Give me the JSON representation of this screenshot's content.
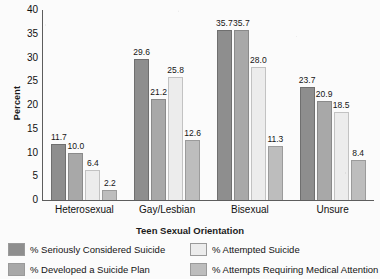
{
  "chart_data": {
    "type": "bar",
    "title": "",
    "xlabel": "Teen Sexual Orientation",
    "ylabel": "Percent",
    "ylim": [
      0,
      40
    ],
    "ytick_step": 5,
    "yticks": [
      "40",
      "35",
      "30",
      "25",
      "20",
      "15",
      "10",
      "5",
      "0"
    ],
    "grid": false,
    "legend_position": "bottom",
    "categories": [
      "Heterosexual",
      "Gay/Lesbian",
      "Bisexual",
      "Unsure"
    ],
    "series": [
      {
        "name": "% Seriously Considered Suicide",
        "color": "#8e8e8e",
        "values": [
          11.7,
          29.6,
          35.7,
          23.7
        ],
        "labels": [
          "11.7",
          "29.6",
          "35.7",
          "23.7"
        ]
      },
      {
        "name": "% Developed a Suicide Plan",
        "color": "#a8a8a8",
        "values": [
          10.0,
          21.2,
          35.7,
          20.9
        ],
        "labels": [
          "10.0",
          "21.2",
          "35.7",
          "20.9"
        ]
      },
      {
        "name": "% Attempted Suicide",
        "color": "#ececec",
        "values": [
          6.4,
          25.8,
          28.0,
          18.5
        ],
        "labels": [
          "6.4",
          "25.8",
          "28.0",
          "18.5"
        ]
      },
      {
        "name": "% Attempts Requiring Medical Attention",
        "color": "#bdbdbd",
        "values": [
          2.2,
          12.6,
          11.3,
          8.4
        ],
        "labels": [
          "2.2",
          "12.6",
          "11.3",
          "8.4"
        ]
      }
    ]
  },
  "legend": {
    "entries": [
      {
        "label": "% Seriously Considered Suicide"
      },
      {
        "label": "% Attempted Suicide"
      },
      {
        "label": "% Developed a Suicide Plan"
      },
      {
        "label": "% Attempts Requiring Medical Attention"
      }
    ]
  }
}
